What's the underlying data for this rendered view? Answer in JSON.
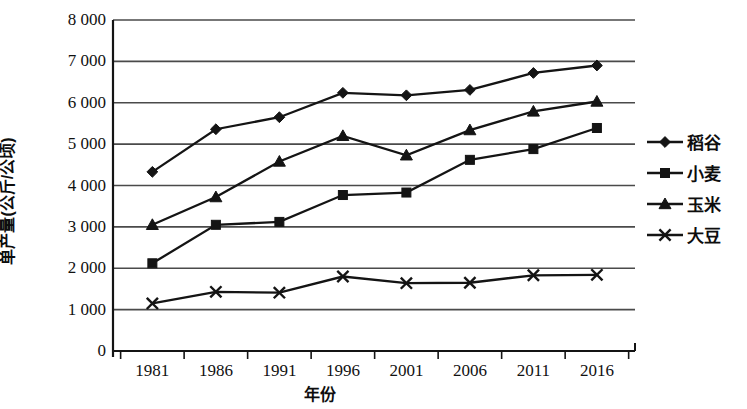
{
  "chart_data": {
    "type": "line",
    "title": "",
    "xlabel": "年份",
    "ylabel": "单产量(公斤/公顷)",
    "categories": [
      "1981",
      "1986",
      "1991",
      "1996",
      "2001",
      "2006",
      "2011",
      "2016"
    ],
    "x_tick_labels": [
      "1981",
      "1986",
      "1991",
      "1996",
      "2001",
      "2006",
      "2011",
      "2016"
    ],
    "y_tick_labels": [
      "0",
      "1 000",
      "2 000",
      "3 000",
      "4 000",
      "5 000",
      "6 000",
      "7 000",
      "8 000"
    ],
    "y_tick_values": [
      0,
      1000,
      2000,
      3000,
      4000,
      5000,
      6000,
      7000,
      8000
    ],
    "ylim": [
      0,
      8000
    ],
    "grid": "horizontal",
    "legend_position": "right",
    "series": [
      {
        "name": "稻谷",
        "marker": "diamond",
        "values": [
          4330,
          5360,
          5650,
          6240,
          6180,
          6310,
          6720,
          6900
        ]
      },
      {
        "name": "小麦",
        "marker": "square",
        "values": [
          2120,
          3050,
          3120,
          3770,
          3830,
          4620,
          4880,
          5390
        ]
      },
      {
        "name": "玉米",
        "marker": "triangle",
        "values": [
          3050,
          3720,
          4580,
          5200,
          4730,
          5340,
          5790,
          6030
        ]
      },
      {
        "name": "大豆",
        "marker": "cross",
        "values": [
          1150,
          1430,
          1410,
          1800,
          1640,
          1650,
          1830,
          1840
        ]
      }
    ]
  },
  "style": {
    "line_color": "#141414",
    "grid_color": "#4a4a4a",
    "axis_color": "#141414",
    "background": "#ffffff"
  }
}
